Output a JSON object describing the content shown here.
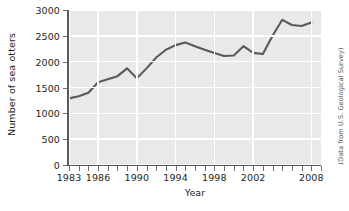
{
  "chart_data": {
    "type": "line",
    "title": "",
    "xlabel": "Year",
    "ylabel": "Number of sea otters",
    "xlim": [
      1983,
      2009
    ],
    "ylim": [
      0,
      3000
    ],
    "grid": true,
    "legend": null,
    "annotations": [
      "(Data from U.S. Geological Survey)"
    ],
    "line_color": "#58595b",
    "plot_background": "#e9e9e9",
    "gridline_color": "#ffffff",
    "y_ticks": [
      0,
      500,
      1000,
      1500,
      2000,
      2500,
      3000
    ],
    "y_tick_labels": [
      "0",
      "500",
      "1000",
      "1500",
      "2000",
      "2500",
      "3000"
    ],
    "x_ticks": [
      1983,
      1984,
      1985,
      1986,
      1987,
      1988,
      1989,
      1990,
      1991,
      1992,
      1993,
      1994,
      1995,
      1996,
      1997,
      1998,
      1999,
      2000,
      2001,
      2002,
      2003,
      2004,
      2005,
      2006,
      2007,
      2008,
      2009
    ],
    "x_tick_labels": [
      {
        "value": 1983,
        "label": "1983"
      },
      {
        "value": 1986,
        "label": "1986"
      },
      {
        "value": 1990,
        "label": "1990"
      },
      {
        "value": 1994,
        "label": "1994"
      },
      {
        "value": 1998,
        "label": "1998"
      },
      {
        "value": 2002,
        "label": "2002"
      },
      {
        "value": 2008,
        "label": "2008"
      }
    ],
    "x": [
      1983,
      1984,
      1985,
      1986,
      1987,
      1988,
      1989,
      1990,
      1991,
      1992,
      1993,
      1994,
      1995,
      1996,
      1997,
      1998,
      1999,
      2000,
      2001,
      2002,
      2003,
      2004,
      2005,
      2006,
      2007,
      2008
    ],
    "values": [
      1290,
      1330,
      1400,
      1600,
      1660,
      1720,
      1870,
      1680,
      1870,
      2080,
      2230,
      2320,
      2370,
      2300,
      2230,
      2170,
      2110,
      2120,
      2300,
      2170,
      2150,
      2500,
      2810,
      2710,
      2690,
      2760
    ],
    "series": [
      {
        "name": "Number of sea otters",
        "values": [
          1290,
          1330,
          1400,
          1600,
          1660,
          1720,
          1870,
          1680,
          1870,
          2080,
          2230,
          2320,
          2370,
          2300,
          2230,
          2170,
          2110,
          2120,
          2300,
          2170,
          2150,
          2500,
          2810,
          2710,
          2690,
          2760
        ]
      }
    ]
  },
  "source": {
    "credit": "(Data from U.S. Geological Survey)"
  }
}
